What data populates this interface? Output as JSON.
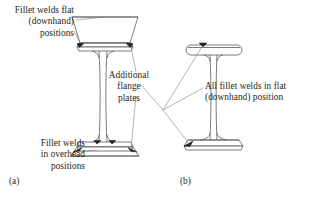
{
  "figure": {
    "type": "engineering-diagram",
    "background_color": "#ffffff",
    "line_color": "#58595b",
    "weld_color": "#231f20",
    "text_color": "#231f20"
  },
  "callouts": {
    "flat_top": "Fillet welds flat\n(downhand)\npositions",
    "overhead": "Fillet welds\nin overhead\npositions",
    "additional_flange": "Additional\nflange\nplates",
    "all_flat": "All fillet welds in flat\n(downhand) position"
  },
  "subcaptions": {
    "a": "(a)",
    "b": "(b)"
  },
  "beams": [
    {
      "id": "a",
      "label": "(a)",
      "description": "I-beam shown in perspective with additional flange plates welded to top and bottom flanges",
      "has_additional_plates": true,
      "weld_positions": [
        "flat (downhand)",
        "overhead"
      ]
    },
    {
      "id": "b",
      "label": "(b)",
      "description": "I-beam with all fillet welds made in the flat (downhand) position",
      "has_additional_plates": false,
      "weld_positions": [
        "flat (downhand)"
      ]
    }
  ]
}
